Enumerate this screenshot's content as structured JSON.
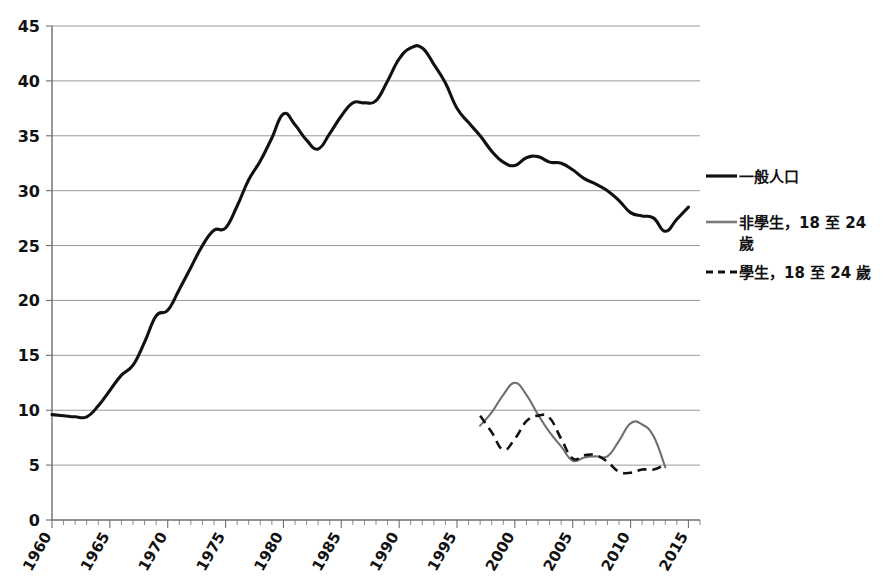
{
  "chart_data": {
    "type": "line",
    "title": "",
    "xlabel": "",
    "ylabel": "",
    "xlim": [
      1960,
      2016
    ],
    "ylim": [
      0,
      45
    ],
    "grid": true,
    "legend_position": "right",
    "y_ticks": [
      0,
      5,
      10,
      15,
      20,
      25,
      30,
      35,
      40,
      45
    ],
    "x_ticks": [
      1960,
      1965,
      1970,
      1975,
      1980,
      1985,
      1990,
      1995,
      2000,
      2005,
      2010,
      2015
    ],
    "x_tick_labels": [
      "1960",
      "1965",
      "1970",
      "1975",
      "1980",
      "1985",
      "1990",
      "1995",
      "2000",
      "2005",
      "2010",
      "2015"
    ],
    "y_tick_labels": [
      "0",
      "5",
      "10",
      "15",
      "20",
      "25",
      "30",
      "35",
      "40",
      "45"
    ],
    "series": [
      {
        "name": "一般人口",
        "style": "solid",
        "color": "#111111",
        "width": 3.1,
        "x": [
          1960,
          1961,
          1962,
          1963,
          1964,
          1965,
          1966,
          1967,
          1968,
          1969,
          1970,
          1971,
          1972,
          1973,
          1974,
          1975,
          1976,
          1977,
          1978,
          1979,
          1980,
          1981,
          1982,
          1983,
          1984,
          1985,
          1986,
          1987,
          1988,
          1989,
          1990,
          1991,
          1992,
          1993,
          1994,
          1995,
          1996,
          1997,
          1998,
          1999,
          2000,
          2001,
          2002,
          2003,
          2004,
          2005,
          2006,
          2007,
          2008,
          2009,
          2010,
          2011,
          2012,
          2013,
          2014,
          2015
        ],
        "values": [
          9.6,
          9.5,
          9.4,
          9.4,
          10.4,
          11.8,
          13.2,
          14.1,
          16.2,
          18.6,
          19.1,
          21.0,
          23.0,
          25.0,
          26.4,
          26.6,
          28.6,
          31.0,
          32.7,
          34.8,
          37.0,
          36.0,
          34.6,
          33.8,
          35.2,
          36.8,
          38.0,
          38.0,
          38.2,
          40.0,
          42.0,
          43.0,
          43.0,
          41.5,
          39.8,
          37.5,
          36.2,
          35.0,
          33.6,
          32.6,
          32.3,
          33.0,
          33.1,
          32.6,
          32.5,
          31.9,
          31.1,
          30.6,
          30.0,
          29.1,
          28.0,
          27.7,
          27.5,
          26.3,
          27.4,
          28.5
        ]
      },
      {
        "name": "非學生，18 至 24 歲",
        "style": "solid",
        "color": "#6f6f6f",
        "width": 2.1,
        "x": [
          1997,
          1998,
          1999,
          2000,
          2001,
          2002,
          2003,
          2004,
          2005,
          2006,
          2007,
          2008,
          2009,
          2010,
          2011,
          2012,
          2013
        ],
        "values": [
          8.6,
          9.8,
          11.4,
          12.5,
          11.4,
          9.6,
          8.0,
          6.7,
          5.4,
          5.7,
          5.8,
          5.8,
          7.2,
          8.8,
          8.7,
          7.6,
          4.8
        ]
      },
      {
        "name": "學生，18 至 24 歲",
        "style": "dashed",
        "color": "#111111",
        "width": 2.6,
        "x": [
          1997,
          1998,
          1999,
          2000,
          2001,
          2002,
          2003,
          2004,
          2005,
          2006,
          2007,
          2008,
          2009,
          2010,
          2011,
          2012,
          2013
        ],
        "values": [
          9.5,
          8.0,
          6.4,
          7.4,
          9.0,
          9.5,
          9.3,
          7.4,
          5.6,
          5.9,
          5.9,
          5.3,
          4.4,
          4.3,
          4.6,
          4.6,
          5.1
        ]
      }
    ],
    "legend": [
      {
        "label": "一般人口",
        "style": "solid",
        "color": "#111111"
      },
      {
        "label": "非學生，18 至 24 歲",
        "style": "solid",
        "color": "#7a7a7a"
      },
      {
        "label": "學生，18 至 24 歲",
        "style": "dashed",
        "color": "#111111"
      }
    ]
  },
  "legend_text": {
    "general": "一般人口",
    "nonstudent_line1": "非學生，18 至 24",
    "nonstudent_line2": "歲",
    "student": "學生，18 至 24 歲"
  }
}
